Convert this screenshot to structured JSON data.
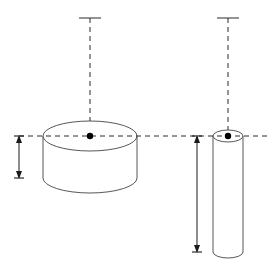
{
  "figure": {
    "background_color": "#ffffff",
    "outline_color": "#444444",
    "centerline_color": "#2b2b2b",
    "dimension_color": "#1a1a1a",
    "width_px": 279,
    "height_px": 280
  },
  "axes": {
    "horizontal_centerline": {
      "label": "horizontal axis",
      "y": 136,
      "x_start": 19,
      "x_end": 268,
      "style": "dashed"
    },
    "vertical_centerline_left": {
      "label": "left vertical axis",
      "x": 90,
      "y_start": 18,
      "y_end": 136,
      "cap_width": 22,
      "style": "dashed"
    },
    "vertical_centerline_right": {
      "label": "right vertical axis",
      "x": 228,
      "y_start": 18,
      "y_end": 136,
      "cap_width": 22,
      "style": "dashed"
    }
  },
  "shapes": {
    "left_cylinder": {
      "name": "wide short cylinder",
      "center_x": 90,
      "center_y": 136,
      "radius_x": 47,
      "radius_y": 15,
      "top_y": 136,
      "bottom_y": 178,
      "height": 42,
      "description": "short wide disc with elliptical top face"
    },
    "right_cylinder": {
      "name": "tall narrow cylinder",
      "center_x": 228,
      "center_y": 136,
      "radius_x": 15,
      "radius_y": 6,
      "top_y": 136,
      "bottom_y": 252,
      "height": 116,
      "description": "tall slender rod with elliptical top face"
    }
  },
  "dimensions": {
    "left_height_arrow": {
      "name": "left cylinder height dimension",
      "x": 19,
      "y_top": 136,
      "y_bottom": 178,
      "tick_half_width": 5,
      "value_label": ""
    },
    "right_height_arrow": {
      "name": "right cylinder height dimension",
      "x": 197,
      "y_top": 136,
      "y_bottom": 252,
      "tick_half_width": 5,
      "value_label": ""
    }
  },
  "markers": {
    "left_center_dot": {
      "x": 90,
      "y": 136,
      "r": 3.2
    },
    "right_center_dot": {
      "x": 228,
      "y": 136,
      "r": 3.2
    }
  }
}
